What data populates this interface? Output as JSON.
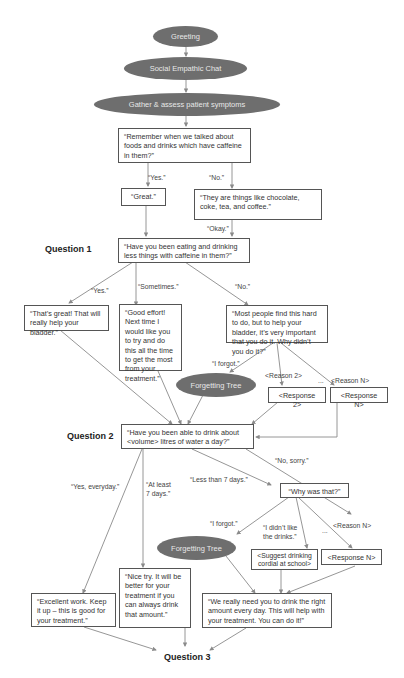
{
  "diagram": {
    "type": "flowchart",
    "colors": {
      "oval_fill": "#6e6e6e",
      "oval_text": "#e8e8e8",
      "box_border": "#555555",
      "edge": "#8a8a8a"
    },
    "ovals": {
      "greeting": "Greeting",
      "social": "Social Empathic Chat",
      "gather": "Gather & assess patient symptoms",
      "forgetting1": "Forgetting Tree",
      "forgetting2": "Forgetting Tree"
    },
    "questions": {
      "q1": "Question 1",
      "q2": "Question 2",
      "q3": "Question 3"
    },
    "boxes": {
      "remember": "“Remember when we talked about foods and drinks which have caffeine in them?”",
      "great": "“Great.”",
      "theyare": "“They are things like chocolate, coke, tea, and coffee.”",
      "q1_text": "“Have you been eating and drinking less things with caffeine in them?”",
      "thatsgreat": "“That’s great! That will really help your bladder.”",
      "goodeffort": "“Good effort! Next time I would like you to try and do this all the time to get the most from your treatment.”",
      "mostpeople": "“Most people find this hard to do, but to help your bladder, it’s very important that you do it. Why didn’t you do it?”",
      "response2": "<Response 2>",
      "responseN1": "<Response N>",
      "q2_text": "“Have you been able to drink about <volume> litres of water a day?”",
      "whywas": "“Why was that?”",
      "suggest": "<Suggest drinking cordial at school>",
      "responseN2": "<Response N>",
      "excellent": "“Excellent work. Keep it up – this is good for your treatment.”",
      "nicetry": "“Nice try. It will be better for your treatment if you can always drink that amount.”",
      "wereally": "“We really need you to drink the right amount every day. This will help with your treatment. You can do it!”"
    },
    "edge_labels": {
      "yes1": "“Yes.”",
      "no1": "“No.”",
      "okay": "“Okay.”",
      "yes2": "“Yes.”",
      "sometimes": "“Sometimes.”",
      "no2": "“No.”",
      "iforgot1": "“I forgot.”",
      "reason2": "<Reason 2>",
      "ellipsis1": "...",
      "reasonN1": "<Reason N>",
      "nosorry": "“No, sorry.”",
      "yeseveryday": "“Yes, everyday.”",
      "atleast": "“At least 7 days.”",
      "lessthan": "“Less than 7 days.”",
      "iforgot2": "“I forgot.”",
      "ididnt": "“I didn’t like the drinks.”",
      "ellipsis2": "...",
      "reasonN2": "<Reason N>"
    }
  }
}
